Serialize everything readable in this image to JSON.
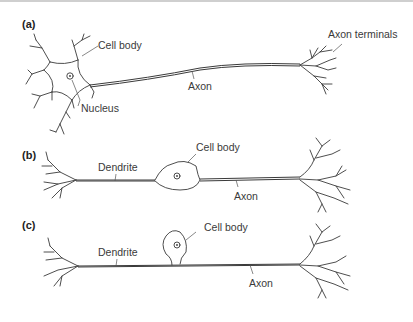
{
  "figure": {
    "panels": [
      {
        "id": "a",
        "label": "(a)",
        "type": "multipolar neuron",
        "annotations": {
          "cell_body": "Cell body",
          "nucleus": "Nucleus",
          "axon": "Axon",
          "axon_terminals": "Axon terminals"
        }
      },
      {
        "id": "b",
        "label": "(b)",
        "type": "bipolar neuron",
        "annotations": {
          "dendrite": "Dendrite",
          "cell_body": "Cell body",
          "axon": "Axon"
        }
      },
      {
        "id": "c",
        "label": "(c)",
        "type": "unipolar neuron",
        "annotations": {
          "dendrite": "Dendrite",
          "cell_body": "Cell body",
          "axon": "Axon"
        }
      }
    ],
    "colors": {
      "line": "#3a3a3a",
      "text": "#3a3a3a",
      "background": "#ffffff",
      "top_border": "#cfcfcf"
    }
  }
}
